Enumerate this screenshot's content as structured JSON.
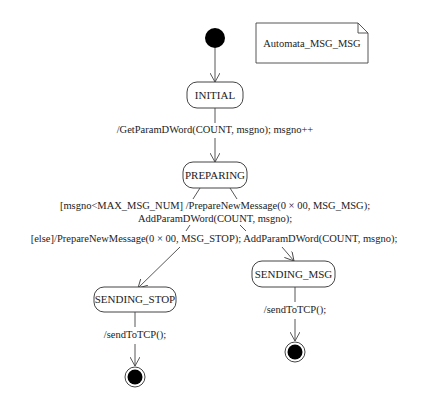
{
  "note": {
    "text": "Automata_MSG_MSG"
  },
  "states": {
    "initial_pseudostate": {
      "kind": "initial"
    },
    "initial": {
      "label": "INITIAL"
    },
    "preparing": {
      "label": "PREPARING"
    },
    "sending_stop": {
      "label": "SENDING_STOP"
    },
    "sending_msg": {
      "label": "SENDING_MSG"
    },
    "final_stop": {
      "kind": "final"
    },
    "final_msg": {
      "kind": "final"
    }
  },
  "transitions": {
    "start_to_initial": {
      "label": ""
    },
    "initial_to_preparing": {
      "label": "/GetParamDWord(COUNT, msgno); msgno++"
    },
    "preparing_to_sending_msg": {
      "label_line1": "[msgno<MAX_MSG_NUM] /PrepareNewMessage(0 × 00, MSG_MSG);",
      "label_line2": "AddParamDWord(COUNT, msgno);"
    },
    "preparing_to_sending_stop": {
      "label": "[else]/PrepareNewMessage(0 × 00, MSG_STOP); AddParamDWord(COUNT, msgno);"
    },
    "sending_stop_to_final": {
      "label": "/sendToTCP();"
    },
    "sending_msg_to_final": {
      "label": "/sendToTCP();"
    }
  }
}
